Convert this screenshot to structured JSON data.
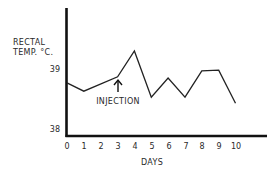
{
  "chart_data": {
    "type": "line",
    "title": "",
    "xlabel": "DAYS",
    "ylabel": "RECTAL TEMP. °C.",
    "ylabel_lines": [
      "RECTAL",
      "TEMP. °C."
    ],
    "x_ticks": [
      "0",
      "1",
      "2",
      "3",
      "4",
      "5",
      "6",
      "7",
      "8",
      "9",
      "10"
    ],
    "y_ticks": [
      "39",
      "38"
    ],
    "xlim": [
      0,
      12
    ],
    "ylim": [
      37.9,
      40.0
    ],
    "grid": false,
    "legend": null,
    "series": [
      {
        "name": "Rectal temperature",
        "x": [
          0,
          1,
          3,
          4,
          5,
          6,
          7,
          8,
          9,
          10
        ],
        "values": [
          38.77,
          38.63,
          38.87,
          39.3,
          38.53,
          38.85,
          38.53,
          38.97,
          38.98,
          38.43
        ]
      }
    ],
    "annotations": [
      {
        "text": "INJECTION",
        "x": 3,
        "arrow": "up"
      }
    ]
  },
  "labels": {
    "ylabel_line1": "RECTAL",
    "ylabel_line2": "TEMP. °C.",
    "xlabel": "DAYS",
    "annotation": "INJECTION",
    "y39": "39",
    "y38": "38",
    "x0": "0",
    "x1": "1",
    "x2": "2",
    "x3": "3",
    "x4": "4",
    "x5": "5",
    "x6": "6",
    "x7": "7",
    "x8": "8",
    "x9": "9",
    "x10": "10"
  }
}
